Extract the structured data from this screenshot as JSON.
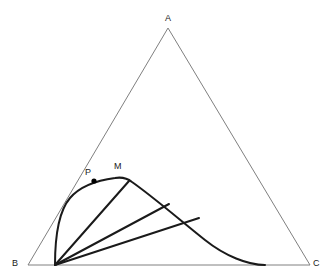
{
  "figure": {
    "background_color": "#ffffff",
    "width": 334,
    "height": 280
  },
  "colors": {
    "triangle_stroke": "#808080",
    "curve_stroke": "#1a1a1a",
    "chord_stroke": "#1a1a1a",
    "point_fill": "#000000",
    "label_color": "#1a1a1a"
  },
  "triangle": {
    "name": "ABC",
    "stroke_width": 1,
    "vertices": [
      {
        "id": "A",
        "label": "A",
        "x": 168,
        "y": 28,
        "label_x": 165,
        "label_y": 14
      },
      {
        "id": "B",
        "label": "B",
        "x": 28,
        "y": 265,
        "label_x": 12,
        "label_y": 259
      },
      {
        "id": "C",
        "label": "C",
        "x": 310,
        "y": 265,
        "label_x": 313,
        "label_y": 259
      }
    ]
  },
  "curve": {
    "name": "trajectory-arc",
    "stroke_width": 2,
    "path": "M 55 265 C 55 238 58 212 70 198 C 82 184 100 180 115 178 C 121 177 127 178 132 182 C 152 196 180 220 205 240 C 225 256 248 265 265 265",
    "start_point": {
      "x": 55,
      "y": 265
    },
    "end_point": {
      "x": 265,
      "y": 265
    }
  },
  "points": [
    {
      "id": "P",
      "label": "P",
      "x": 94,
      "y": 181,
      "radius": 2.6,
      "label_x": 85,
      "label_y": 168,
      "marked": true
    },
    {
      "id": "M",
      "label": "M",
      "x": 122,
      "y": 178,
      "radius": 0,
      "label_x": 114,
      "label_y": 162,
      "marked": false
    }
  ],
  "chords": {
    "name": "radiating-chords",
    "stroke_width": 2,
    "origin": {
      "x": 55,
      "y": 265
    },
    "segments": [
      {
        "id": "chord-1",
        "x2": 129,
        "y2": 181
      },
      {
        "id": "chord-2",
        "x2": 169,
        "y2": 204
      },
      {
        "id": "chord-3",
        "x2": 199,
        "y2": 218
      }
    ]
  }
}
